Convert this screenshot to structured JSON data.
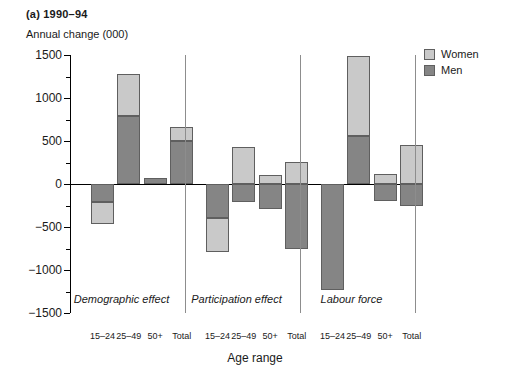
{
  "title": "(a) 1990–94",
  "axis": {
    "ylabel": "Annual change (000)",
    "xlabel": "Age range",
    "yticks": [
      1500,
      1000,
      500,
      0,
      -500,
      -1000,
      -1500
    ],
    "ytick_labels": [
      "1500",
      "1000",
      "500",
      "0",
      "−500",
      "−1000",
      "−1500"
    ],
    "ylim": [
      -1500,
      1500
    ]
  },
  "legend": {
    "position": "top-right",
    "entries": [
      {
        "label": "Women",
        "color": "#c9c9c9"
      },
      {
        "label": "Men",
        "color": "#858585"
      }
    ]
  },
  "chart_data": {
    "type": "bar",
    "title": "(a) 1990–94",
    "xlabel": "Age range",
    "ylabel": "Annual change (000)",
    "ylim": [
      -1500,
      1500
    ],
    "grid": false,
    "stacked": true,
    "legend_position": "top-right",
    "categories": [
      "15–24",
      "25–49",
      "50+",
      "Total"
    ],
    "panels": [
      {
        "name": "Demographic effect",
        "series": [
          {
            "name": "Men",
            "values": [
              -210,
              790,
              75,
              500
            ]
          },
          {
            "name": "Women",
            "values": [
              -250,
              490,
              0,
              160
            ]
          }
        ],
        "totals": [
          -460,
          1280,
          75,
          660
        ]
      },
      {
        "name": "Participation effect",
        "series": [
          {
            "name": "Men",
            "values": [
              -400,
              -215,
              -290,
              -760
            ]
          },
          {
            "name": "Women",
            "values": [
              -390,
              425,
              110,
              255
            ]
          }
        ],
        "totals": [
          -790,
          425,
          110,
          255
        ]
      },
      {
        "name": "Labour force",
        "series": [
          {
            "name": "Men",
            "values": [
              -1230,
              555,
              -200,
              -255
            ]
          },
          {
            "name": "Women",
            "values": [
              0,
              935,
              120,
              455
            ]
          }
        ],
        "totals": [
          -1230,
          1490,
          120,
          455
        ]
      }
    ]
  }
}
